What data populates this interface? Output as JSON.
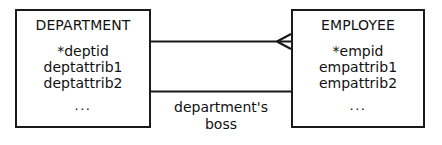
{
  "diagram": {
    "type": "entity-relationship-diagram",
    "notation": "crow's foot",
    "stroke_color": "#1a1a1a",
    "text_color": "#111111",
    "background_color": "#ffffff"
  },
  "entities": [
    {
      "id": "department",
      "title": "DEPARTMENT",
      "attributes": [
        "*deptid",
        "deptattrib1",
        "deptattrib2"
      ],
      "ellipsis": "..."
    },
    {
      "id": "employee",
      "title": "EMPLOYEE",
      "attributes": [
        "*empid",
        "empattrib1",
        "empattrib2"
      ],
      "ellipsis": "..."
    }
  ],
  "relationships": [
    {
      "id": "employs",
      "from": "department",
      "to": "employee",
      "to_cardinality": "many",
      "from_cardinality": "one",
      "label": ""
    },
    {
      "id": "departments-boss",
      "from": "department",
      "to": "employee",
      "to_cardinality": "one",
      "from_cardinality": "one",
      "label_line1": "department's",
      "label_line2": "boss"
    }
  ]
}
